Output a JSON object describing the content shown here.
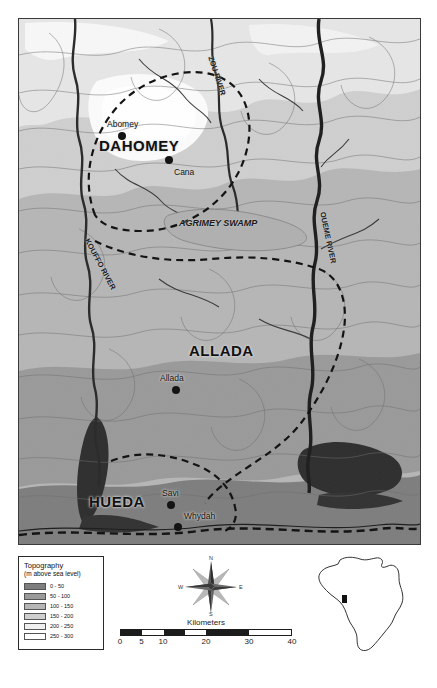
{
  "map": {
    "title": "Topographic map of the Dahomey, Allada and Hueda kingdoms",
    "kingdoms": [
      {
        "name": "DAHOMEY",
        "x": 80,
        "y": 118,
        "size": 16
      },
      {
        "name": "ALLADA",
        "x": 170,
        "y": 323,
        "size": 16
      },
      {
        "name": "HUEDA",
        "x": 70,
        "y": 474,
        "size": 16
      }
    ],
    "cities": [
      {
        "name": "Abomey",
        "label_x": 88,
        "label_y": 100,
        "dot_x": 99,
        "dot_y": 113
      },
      {
        "name": "Cana",
        "label_x": 148,
        "label_y": 150,
        "dot_x": 146,
        "dot_y": 137
      },
      {
        "name": "Allada",
        "label_x": 141,
        "label_y": 354,
        "dot_x": 153,
        "dot_y": 367
      },
      {
        "name": "Savi",
        "label_x": 145,
        "label_y": 471,
        "dot_x": 148,
        "dot_y": 482
      },
      {
        "name": "Whydah",
        "label_x": 152,
        "label_y": 492,
        "dot_x": 155,
        "dot_y": 504
      }
    ],
    "rivers": [
      {
        "name": "ZOU RIVER",
        "x": 211,
        "y": 40,
        "rotate": 72
      },
      {
        "name": "KOUFFO RIVER",
        "x": 73,
        "y": 222,
        "rotate": 62
      },
      {
        "name": "OUEME RIVER",
        "x": 309,
        "y": 196,
        "rotate": 78
      }
    ],
    "features": [
      {
        "name": "AGRIMEY SWAMP",
        "x": 168,
        "y": 204
      }
    ]
  },
  "legend": {
    "title": "Topography",
    "subtitle": "(m above sea level)",
    "classes": [
      {
        "label": "0 - 50",
        "color": "#7e7e7e"
      },
      {
        "label": "50 - 100",
        "color": "#9a9a9a"
      },
      {
        "label": "100 - 150",
        "color": "#b6b6b6"
      },
      {
        "label": "150 - 200",
        "color": "#cfcfcf"
      },
      {
        "label": "200 - 250",
        "color": "#efefef"
      },
      {
        "label": "250 - 300",
        "color": "#ffffff"
      }
    ]
  },
  "compass": {
    "north": "N",
    "east": "E",
    "south": "S",
    "west": "W"
  },
  "scale": {
    "caption": "Kilometers",
    "ticks": [
      "0",
      "5",
      "10",
      "20",
      "30",
      "40"
    ],
    "tick_positions": [
      0,
      12.5,
      25,
      50,
      75,
      100
    ],
    "segments": [
      {
        "fill": "dark",
        "width": 12.5
      },
      {
        "fill": "light",
        "width": 12.5
      },
      {
        "fill": "dark",
        "width": 12.5
      },
      {
        "fill": "light",
        "width": 12.5
      },
      {
        "fill": "dark",
        "width": 25
      },
      {
        "fill": "light",
        "width": 25
      }
    ]
  },
  "inset": {
    "name": "Africa locator map",
    "marker_label": "study area"
  }
}
